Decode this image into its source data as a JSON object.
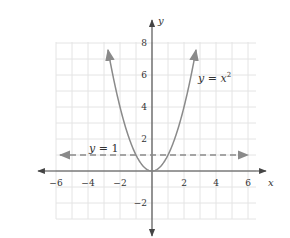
{
  "chart_data": {
    "type": "line",
    "title": "",
    "xlabel": "x",
    "ylabel": "y",
    "xlim": [
      -7,
      6.5
    ],
    "ylim": [
      -3.7,
      8
    ],
    "grid": true,
    "x_ticks": [
      -6,
      -4,
      -2,
      2,
      4,
      6
    ],
    "y_ticks": [
      8,
      6,
      4,
      2,
      -2
    ],
    "x_tick_labels": [
      "−6",
      "−4",
      "−2",
      "2",
      "4",
      "6"
    ],
    "y_tick_labels": [
      "8",
      "6",
      "4",
      "2",
      "−2"
    ],
    "series": [
      {
        "name": "y = x^2",
        "style": "solid",
        "color": "#8a8a8a",
        "function": "x^2",
        "x": [
          -2.83,
          -2,
          -1,
          0,
          1,
          2,
          2.83
        ],
        "y": [
          8,
          4,
          1,
          0,
          1,
          4,
          8
        ],
        "arrows": "both ends"
      },
      {
        "name": "y = 1",
        "style": "dashed",
        "color": "#8a8a8a",
        "function": "1",
        "x": [
          -6.5,
          6
        ],
        "y": [
          1,
          1
        ],
        "arrows": "both ends"
      }
    ],
    "annotations": [
      {
        "text": "y = x²",
        "x": 3.3,
        "y": 5.6
      },
      {
        "text": "y = 1",
        "x": -5.4,
        "y": 1.3
      }
    ]
  },
  "labels": {
    "x_axis": "x",
    "y_axis": "y",
    "parabola_label_lhs": "y",
    "parabola_label_eq": " = ",
    "parabola_label_var": "x",
    "parabola_label_exp": "2",
    "line_label_lhs": "y",
    "line_label_rest": " = 1"
  },
  "ticks": {
    "x": [
      {
        "label": "−6",
        "value": -6
      },
      {
        "label": "−4",
        "value": -4
      },
      {
        "label": "−2",
        "value": -2
      },
      {
        "label": "2",
        "value": 2
      },
      {
        "label": "4",
        "value": 4
      },
      {
        "label": "6",
        "value": 6
      }
    ],
    "y": [
      {
        "label": "8",
        "value": 8
      },
      {
        "label": "6",
        "value": 6
      },
      {
        "label": "4",
        "value": 4
      },
      {
        "label": "2",
        "value": 2
      },
      {
        "label": "−2",
        "value": -2
      }
    ]
  },
  "colors": {
    "grid": "#e4e4e4",
    "axis": "#444444",
    "curve": "#8a8a8a",
    "text": "#333333"
  }
}
